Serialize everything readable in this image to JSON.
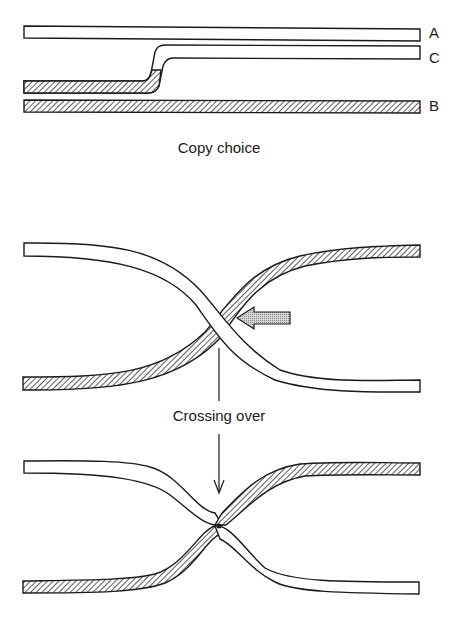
{
  "panels": {
    "copy_choice": {
      "caption": "Copy choice",
      "strand_labels": {
        "a": "A",
        "c": "C",
        "b": "B"
      }
    },
    "crossing_over": {
      "caption": "Crossing over"
    }
  },
  "legend": {
    "white_strand": "parental strand (unshaded)",
    "hatched_strand": "parental strand (hatched)"
  },
  "colors": {
    "stroke": "#1a1a1a",
    "hatch": "#333333",
    "arrow_fill": "#bdbdbd",
    "background": "#ffffff"
  }
}
